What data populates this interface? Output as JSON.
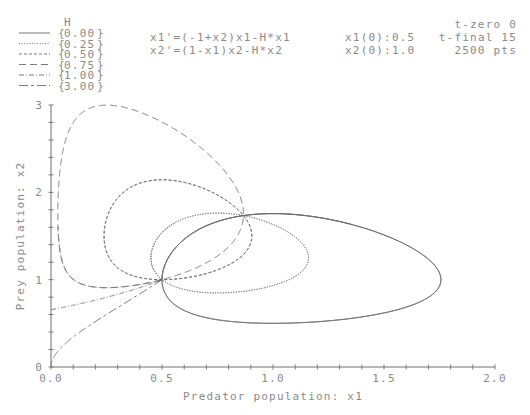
{
  "chart_data": {
    "type": "line",
    "title": "",
    "xlabel": "Predator population:  x1",
    "ylabel": "Prey population:  x2",
    "xlim": [
      0.0,
      2.0
    ],
    "ylim": [
      0,
      3
    ],
    "x_ticks": [
      "0.0",
      "0.5",
      "1.0",
      "1.5",
      "2.0"
    ],
    "x_tick_values": [
      0.0,
      0.5,
      1.0,
      1.5,
      2.0
    ],
    "x_minor_step": 0.1,
    "y_ticks": [
      "0",
      "1",
      "2",
      "3"
    ],
    "y_tick_values": [
      0,
      1,
      2,
      3
    ],
    "y_minor_step": 0.2,
    "grid": false,
    "legend_placement": "top-left",
    "legend_title": "H",
    "equations": [
      "x1'=(-1+x2)x1-H*x1",
      "x2'=(1-x1)x2-H*x2"
    ],
    "initial_conditions": [
      "x1(0):0.5",
      "x2(0):1.0"
    ],
    "time_info": [
      "t-zero 0",
      "t-final 15",
      "2500 pts"
    ],
    "params": {
      "x1_0": 0.5,
      "x2_0": 1.0,
      "t0": 0,
      "tfinal": 15,
      "points": 2500
    },
    "series": [
      {
        "name": "0.00",
        "H": 0.0,
        "style": "solid"
      },
      {
        "name": "0.25",
        "H": 0.25,
        "style": "dotted"
      },
      {
        "name": "0.50",
        "H": 0.5,
        "style": "short-dash"
      },
      {
        "name": "0.75",
        "H": 0.75,
        "style": "long-dash"
      },
      {
        "name": "1.00",
        "H": 1.0,
        "style": "dash-dot"
      },
      {
        "name": "3.00",
        "H": 3.0,
        "style": "long-short-dash"
      }
    ]
  },
  "colors": {
    "line": "#6a6a6a",
    "text": "#8a8a8a",
    "axis": "#6e6e6e"
  }
}
